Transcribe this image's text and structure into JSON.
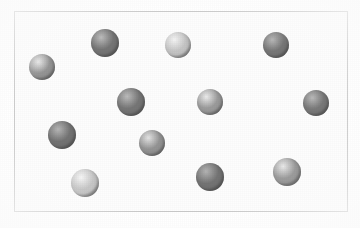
{
  "figure": {
    "width": 360,
    "height": 228,
    "background_color": "#ffffff",
    "particle_count": 13
  },
  "container": {
    "label": "container-box",
    "x": 14,
    "y": 11,
    "width": 334,
    "height": 201,
    "border_color": "#c9c9c9",
    "border_width": 1,
    "fill_color": "#fdfdfd"
  },
  "palette": {
    "dark_sphere": "#6f6f6f",
    "medium_sphere": "#8f8f8f",
    "light_sphere": "#bdbdbd",
    "highlight": "#f2f2f2",
    "shadow": "#4a4a4a",
    "frame": "#c9c9c9",
    "paper": "#ffffff"
  },
  "particles": [
    {
      "id": "particle-1",
      "label": "sphere-top-left",
      "cx": 42,
      "cy": 67,
      "r": 13,
      "shade": "medium",
      "base_color": "#949494",
      "highlight_color": "#e8e8e8"
    },
    {
      "id": "particle-2",
      "label": "sphere-top-upper-left",
      "cx": 105,
      "cy": 43,
      "r": 14,
      "shade": "dark",
      "base_color": "#747474",
      "highlight_color": "#bdbdbd"
    },
    {
      "id": "particle-3",
      "label": "sphere-top-center",
      "cx": 178,
      "cy": 45,
      "r": 13,
      "shade": "light",
      "base_color": "#c4c4c4",
      "highlight_color": "#f4f4f4"
    },
    {
      "id": "particle-4",
      "label": "sphere-top-right",
      "cx": 276,
      "cy": 45,
      "r": 13,
      "shade": "dark",
      "base_color": "#767676",
      "highlight_color": "#b8b8b8"
    },
    {
      "id": "particle-5",
      "label": "sphere-middle-left",
      "cx": 131,
      "cy": 102,
      "r": 14,
      "shade": "dark",
      "base_color": "#757575",
      "highlight_color": "#bcbcbc"
    },
    {
      "id": "particle-6",
      "label": "sphere-middle-center",
      "cx": 210,
      "cy": 102,
      "r": 13,
      "shade": "medium",
      "base_color": "#9a9a9a",
      "highlight_color": "#ececec"
    },
    {
      "id": "particle-7",
      "label": "sphere-middle-right",
      "cx": 316,
      "cy": 103,
      "r": 13,
      "shade": "dark",
      "base_color": "#787878",
      "highlight_color": "#bababa"
    },
    {
      "id": "particle-8",
      "label": "sphere-lower-left",
      "cx": 62,
      "cy": 135,
      "r": 14,
      "shade": "dark",
      "base_color": "#727272",
      "highlight_color": "#b6b6b6"
    },
    {
      "id": "particle-9",
      "label": "sphere-lower-center",
      "cx": 152,
      "cy": 143,
      "r": 13,
      "shade": "medium",
      "base_color": "#939393",
      "highlight_color": "#e4e4e4"
    },
    {
      "id": "particle-10",
      "label": "sphere-bottom-left",
      "cx": 85,
      "cy": 183,
      "r": 14,
      "shade": "light",
      "base_color": "#c6c6c6",
      "highlight_color": "#f6f6f6"
    },
    {
      "id": "particle-11",
      "label": "sphere-bottom-center",
      "cx": 210,
      "cy": 177,
      "r": 14,
      "shade": "dark",
      "base_color": "#737373",
      "highlight_color": "#b4b4b4"
    },
    {
      "id": "particle-12",
      "label": "sphere-bottom-right",
      "cx": 287,
      "cy": 172,
      "r": 14,
      "shade": "medium",
      "base_color": "#9b9b9b",
      "highlight_color": "#eaeaea"
    },
    {
      "id": "particle-13",
      "label": "sphere-upper-left-edge",
      "cx": 42,
      "cy": 67,
      "r": 0,
      "shade": "medium",
      "base_color": "#949494",
      "highlight_color": "#e8e8e8"
    }
  ]
}
